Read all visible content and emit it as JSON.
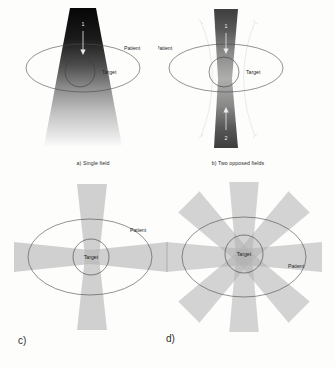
{
  "figure": {
    "background_color": "#fdfdfc",
    "panels": [
      {
        "id": "a",
        "letter": "a)",
        "caption": "a) Single field",
        "patient_label": "Patient",
        "target_label": "Target",
        "beam_labels": [
          "1"
        ],
        "beam_count": 1,
        "description": "Single field"
      },
      {
        "id": "b",
        "letter": "b)",
        "caption": "b) Two opposed fields",
        "patient_label": "Patient",
        "target_label": "Target",
        "beam_labels": [
          "1",
          "2"
        ],
        "beam_count": 2,
        "description": "Two opposed fields"
      },
      {
        "id": "c",
        "letter": "c)",
        "caption": "",
        "patient_label": "Patient",
        "target_label": "Target",
        "beam_labels": [],
        "beam_count": 4,
        "description": "Four crossed fields"
      },
      {
        "id": "d",
        "letter": "d)",
        "caption": "",
        "patient_label": "Patient",
        "target_label": "Target",
        "beam_labels": [],
        "beam_count": 8,
        "description": "Eight fields"
      }
    ]
  },
  "colors": {
    "beam_dark": "#0d0d0d",
    "beam_mid": "#8a8a8a",
    "beam_light": "#d9d9d9",
    "outline": "#4a4a4a",
    "text": "#262626",
    "text_white": "#f2f2f2",
    "guide": "#cfcfcf"
  }
}
